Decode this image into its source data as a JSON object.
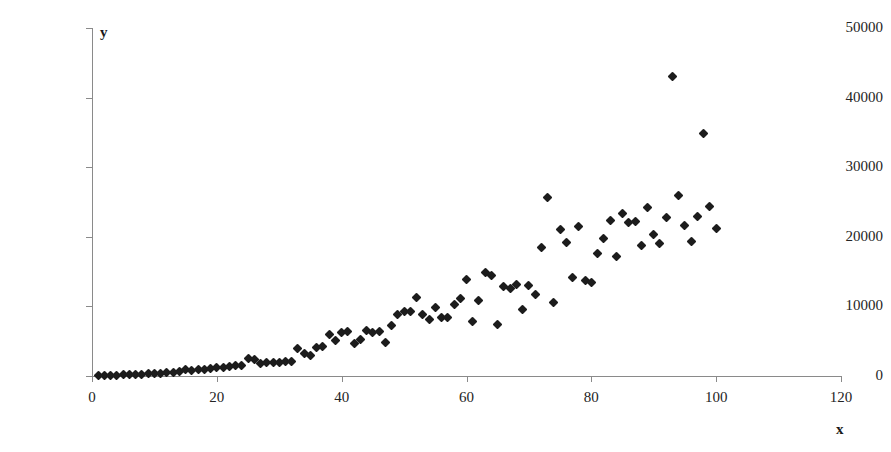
{
  "chart_data": {
    "type": "scatter",
    "title": "",
    "subtitle": "",
    "xlabel": "x",
    "ylabel": "y",
    "xlim": [
      0,
      120
    ],
    "ylim": [
      0,
      50000
    ],
    "xticks": [
      0,
      20,
      40,
      60,
      80,
      100,
      120
    ],
    "yticks": [
      0,
      10000,
      20000,
      30000,
      40000,
      50000
    ],
    "xtick_labels": [
      "0",
      "20",
      "40",
      "60",
      "80",
      "100",
      "120"
    ],
    "ytick_labels": [
      "0",
      "10000",
      "20000",
      "30000",
      "40000",
      "50000"
    ],
    "grid": false,
    "legend": false,
    "legend_position": "none",
    "marker": "diamond",
    "marker_color": "#1c1c1c",
    "series": [
      {
        "name": "series1",
        "points": [
          [
            1,
            60
          ],
          [
            2,
            90
          ],
          [
            3,
            110
          ],
          [
            4,
            140
          ],
          [
            5,
            160
          ],
          [
            6,
            200
          ],
          [
            7,
            230
          ],
          [
            8,
            260
          ],
          [
            9,
            300
          ],
          [
            10,
            340
          ],
          [
            11,
            420
          ],
          [
            12,
            500
          ],
          [
            13,
            560
          ],
          [
            14,
            620
          ],
          [
            15,
            900
          ],
          [
            16,
            760
          ],
          [
            17,
            880
          ],
          [
            18,
            950
          ],
          [
            19,
            1050
          ],
          [
            20,
            1150
          ],
          [
            21,
            1250
          ],
          [
            22,
            1300
          ],
          [
            23,
            1450
          ],
          [
            24,
            1550
          ],
          [
            25,
            2450
          ],
          [
            26,
            2350
          ],
          [
            27,
            1850
          ],
          [
            28,
            1900
          ],
          [
            29,
            1950
          ],
          [
            30,
            2000
          ],
          [
            31,
            2050
          ],
          [
            32,
            2100
          ],
          [
            33,
            3900
          ],
          [
            34,
            3300
          ],
          [
            35,
            2900
          ],
          [
            36,
            4050
          ],
          [
            37,
            4250
          ],
          [
            38,
            5900
          ],
          [
            39,
            5100
          ],
          [
            40,
            6200
          ],
          [
            41,
            6450
          ],
          [
            42,
            4700
          ],
          [
            43,
            5200
          ],
          [
            44,
            6500
          ],
          [
            45,
            6300
          ],
          [
            46,
            6400
          ],
          [
            47,
            4750
          ],
          [
            48,
            7200
          ],
          [
            49,
            8900
          ],
          [
            50,
            9200
          ],
          [
            51,
            9300
          ],
          [
            52,
            11300
          ],
          [
            53,
            8900
          ],
          [
            54,
            8100
          ],
          [
            55,
            9900
          ],
          [
            56,
            8400
          ],
          [
            57,
            8450
          ],
          [
            58,
            10300
          ],
          [
            59,
            11200
          ],
          [
            60,
            13900
          ],
          [
            61,
            7900
          ],
          [
            62,
            10800
          ],
          [
            63,
            14800
          ],
          [
            64,
            14400
          ],
          [
            65,
            7400
          ],
          [
            66,
            12900
          ],
          [
            67,
            12600
          ],
          [
            68,
            13100
          ],
          [
            69,
            9600
          ],
          [
            70,
            13000
          ],
          [
            71,
            11700
          ],
          [
            72,
            18400
          ],
          [
            73,
            25700
          ],
          [
            74,
            10500
          ],
          [
            75,
            21000
          ],
          [
            76,
            19200
          ],
          [
            77,
            14100
          ],
          [
            78,
            21500
          ],
          [
            79,
            13700
          ],
          [
            80,
            13400
          ],
          [
            81,
            17600
          ],
          [
            82,
            19700
          ],
          [
            83,
            22400
          ],
          [
            84,
            17200
          ],
          [
            85,
            23400
          ],
          [
            86,
            22000
          ],
          [
            87,
            22200
          ],
          [
            88,
            18700
          ],
          [
            89,
            24200
          ],
          [
            90,
            20400
          ],
          [
            91,
            19100
          ],
          [
            92,
            22800
          ],
          [
            93,
            43100
          ],
          [
            94,
            25900
          ],
          [
            95,
            21600
          ],
          [
            96,
            19300
          ],
          [
            97,
            22900
          ],
          [
            98,
            34800
          ],
          [
            99,
            24300
          ],
          [
            100,
            21200
          ]
        ]
      }
    ]
  }
}
